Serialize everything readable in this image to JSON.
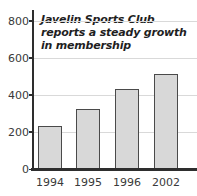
{
  "chart_data": {
    "type": "bar",
    "title": "Javelin Sports Club reports a steady growth in membership",
    "categories": [
      "1994",
      "1995",
      "1996",
      "2002"
    ],
    "values": [
      230,
      325,
      430,
      510
    ],
    "xlabel": "",
    "ylabel": "",
    "ylim": [
      0,
      800
    ],
    "yticks": [
      0,
      200,
      400,
      600,
      800
    ],
    "grid": "horizontal",
    "legend": "none",
    "bar_fill_color": "#d8d8d8",
    "bar_border_color": "#4a4a4a",
    "gridline_color": "#d9d9d9",
    "axis_color": "#2e2e2e",
    "text_color": "#3a3a3a",
    "background_color": "#ffffff"
  }
}
